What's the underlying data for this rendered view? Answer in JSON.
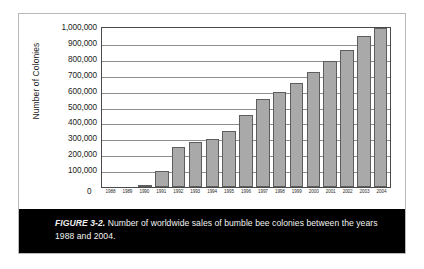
{
  "figure": {
    "caption_label": "FIGURE 3-2.",
    "caption_body": " Number of worldwide sales of bumble bee colonies between the years 1988 and 2004."
  },
  "colors": {
    "bar_fill": "#a9a9a9",
    "bar_stroke": "#5d5d5d",
    "gridline": "#8e8e8e",
    "axis": "#4a4a4a",
    "caption_band": "#000000",
    "caption_text": "#f2f2f2",
    "frame_border": "#b9b9b9"
  },
  "axis": {
    "origin_label": "0"
  },
  "chart_data": {
    "type": "bar",
    "title": "",
    "subtitle": "",
    "xlabel": "",
    "ylabel": "Number of Colonies",
    "ylim": [
      0,
      1000000
    ],
    "ytick_labels": [
      "1,000,000",
      "900,000",
      "800,000",
      "700,000",
      "600,000",
      "500,000",
      "400,000",
      "300,000",
      "200,000",
      "100,000",
      "0"
    ],
    "ytick_values": [
      1000000,
      900000,
      800000,
      700000,
      600000,
      500000,
      400000,
      300000,
      200000,
      100000,
      0
    ],
    "grid": true,
    "grid_orientation": "horizontal",
    "legend": null,
    "legend_position": "none",
    "categories": [
      "1988",
      "1989",
      "1990",
      "1991",
      "1992",
      "1993",
      "1994",
      "1995",
      "1996",
      "1997",
      "1998",
      "1999",
      "2000",
      "2001",
      "2002",
      "2003",
      "2004"
    ],
    "values": [
      0,
      0,
      10000,
      100000,
      250000,
      280000,
      300000,
      350000,
      450000,
      555000,
      600000,
      655000,
      725000,
      790000,
      860000,
      950000,
      1000000
    ],
    "annotations": []
  }
}
